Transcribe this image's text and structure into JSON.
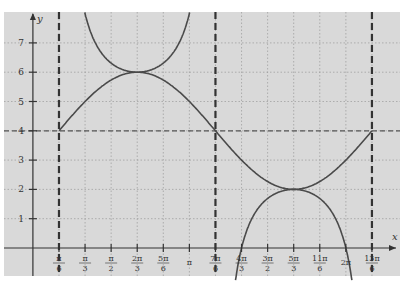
{
  "chart_data": {
    "type": "line",
    "title": "",
    "xlabel": "x",
    "ylabel": "y",
    "xlim_units": "pi/6",
    "xlim": [
      -1,
      13.4
    ],
    "ylim": [
      -0.9,
      7.9
    ],
    "grid": true,
    "x_ticks": [
      {
        "k": 1,
        "label_num": "π",
        "label_den": "6"
      },
      {
        "k": 2,
        "label_num": "π",
        "label_den": "3"
      },
      {
        "k": 3,
        "label_num": "π",
        "label_den": "2"
      },
      {
        "k": 4,
        "label_num": "2π",
        "label_den": "3"
      },
      {
        "k": 5,
        "label_num": "5π",
        "label_den": "6"
      },
      {
        "k": 6,
        "label_num": "π",
        "label_den": ""
      },
      {
        "k": 7,
        "label_num": "7π",
        "label_den": "6"
      },
      {
        "k": 8,
        "label_num": "4π",
        "label_den": "3"
      },
      {
        "k": 9,
        "label_num": "3π",
        "label_den": "2"
      },
      {
        "k": 10,
        "label_num": "5π",
        "label_den": "3"
      },
      {
        "k": 11,
        "label_num": "11π",
        "label_den": "6"
      },
      {
        "k": 12,
        "label_num": "2π",
        "label_den": ""
      },
      {
        "k": 13,
        "label_num": "13π",
        "label_den": "6"
      }
    ],
    "y_ticks": [
      "1",
      "2",
      "3",
      "4",
      "5",
      "6",
      "7"
    ],
    "midline": 4,
    "asymptotes_k": [
      1,
      7,
      13
    ],
    "series": [
      {
        "name": "y = 4 + 2 sin(x − π/6)",
        "style": "solid",
        "key_points": [
          [
            1,
            4
          ],
          [
            4,
            6
          ],
          [
            7,
            4
          ],
          [
            10,
            2
          ],
          [
            13,
            4
          ]
        ]
      },
      {
        "name": "y = 4 + 2 csc(x − π/6)",
        "style": "solid",
        "key_points": [
          [
            4,
            6
          ],
          [
            10,
            2
          ]
        ]
      }
    ]
  },
  "labels": {
    "x_axis": "x",
    "y_axis": "y"
  },
  "colors": {
    "plot_bg": "#d9d9d9",
    "curve": "#4a4a4a",
    "axis": "#333333",
    "grid": "#9a9a9a",
    "asymptote": "#333333"
  }
}
